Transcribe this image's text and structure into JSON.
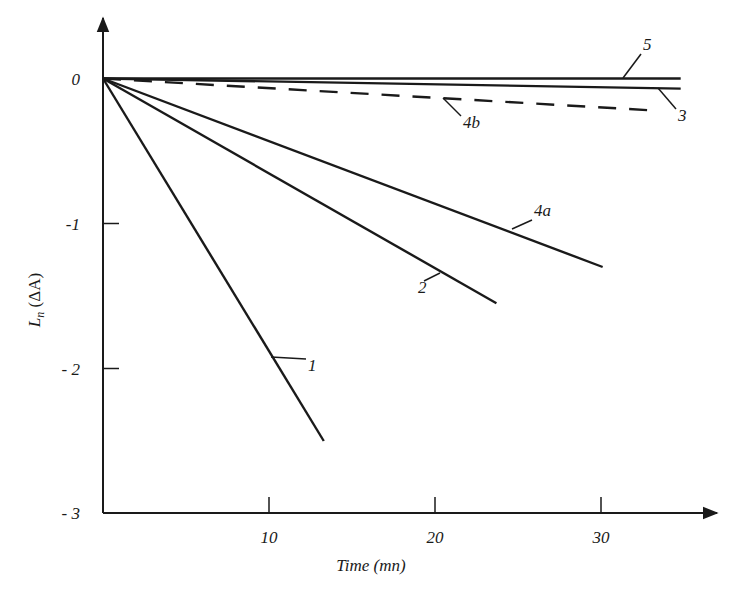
{
  "chart_data": {
    "type": "line",
    "title": "",
    "xlabel": "Time (mn)",
    "ylabel": "Ln (ΔA)",
    "ylabel_main": "L",
    "ylabel_sub": "n",
    "ylabel_rest": " (ΔA)",
    "xlim": [
      0,
      37
    ],
    "ylim": [
      -3,
      0.4
    ],
    "x_ticks": [
      10,
      20,
      30
    ],
    "x_tick_labels": [
      "10",
      "20",
      "30"
    ],
    "y_ticks": [
      0,
      -1,
      -2,
      -3
    ],
    "y_tick_labels": [
      "0",
      "-1",
      "- 2",
      "- 3"
    ],
    "grid": false,
    "legend": "inline callout labels",
    "series": [
      {
        "name": "1",
        "style": "solid",
        "x": [
          0,
          13.3
        ],
        "y": [
          0,
          -2.5
        ]
      },
      {
        "name": "2",
        "style": "solid",
        "x": [
          0,
          23.7
        ],
        "y": [
          0,
          -1.55
        ]
      },
      {
        "name": "3",
        "style": "solid",
        "x": [
          0,
          34.8
        ],
        "y": [
          0,
          -0.07
        ]
      },
      {
        "name": "4a",
        "style": "solid",
        "x": [
          0,
          30.1
        ],
        "y": [
          0,
          -1.3
        ]
      },
      {
        "name": "4b",
        "style": "dashed",
        "x": [
          0,
          33.1
        ],
        "y": [
          0,
          -0.22
        ]
      },
      {
        "name": "5",
        "style": "solid",
        "x": [
          0,
          34.8
        ],
        "y": [
          0,
          0.0
        ]
      }
    ],
    "annotations": [
      {
        "text": "1",
        "series": "1"
      },
      {
        "text": "2",
        "series": "2"
      },
      {
        "text": "3",
        "series": "3"
      },
      {
        "text": "4a",
        "series": "4a"
      },
      {
        "text": "4b",
        "series": "4b"
      },
      {
        "text": "5",
        "series": "5"
      }
    ]
  },
  "colors": {
    "line": "#1a1a1a",
    "background": "#ffffff"
  }
}
